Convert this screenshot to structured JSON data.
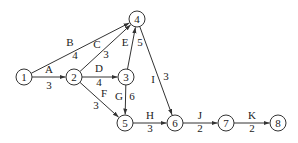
{
  "nodes": [
    {
      "id": "1",
      "label": "1",
      "x": 24,
      "y": 77
    },
    {
      "id": "2",
      "label": "2",
      "x": 74,
      "y": 77
    },
    {
      "id": "3",
      "label": "3",
      "x": 126,
      "y": 77
    },
    {
      "id": "4",
      "label": "4",
      "x": 137,
      "y": 19
    },
    {
      "id": "5",
      "label": "5",
      "x": 125,
      "y": 123
    },
    {
      "id": "6",
      "label": "6",
      "x": 175,
      "y": 123
    },
    {
      "id": "7",
      "label": "7",
      "x": 226,
      "y": 123
    },
    {
      "id": "8",
      "label": "8",
      "x": 278,
      "y": 123
    }
  ],
  "edges": [
    {
      "activity": "A",
      "duration": "3",
      "from": "1",
      "to": "2",
      "lx": 49,
      "ly": 73,
      "dx": 49,
      "dy": 89
    },
    {
      "activity": "B",
      "duration": "4",
      "from": "1",
      "to": "4",
      "lx": 70,
      "ly": 46,
      "dx": 75,
      "dy": 59
    },
    {
      "activity": "C",
      "duration": "3",
      "from": "2",
      "to": "4",
      "lx": 97,
      "ly": 48,
      "dx": 106,
      "dy": 58
    },
    {
      "activity": "D",
      "duration": "4",
      "from": "2",
      "to": "3",
      "lx": 99,
      "ly": 72,
      "dx": 99,
      "dy": 86
    },
    {
      "activity": "E",
      "duration": "5",
      "from": "3",
      "to": "4",
      "lx": 125,
      "ly": 46,
      "dx": 140,
      "dy": 46
    },
    {
      "activity": "F",
      "duration": "3",
      "from": "2",
      "to": "5",
      "lx": 104,
      "ly": 97,
      "dx": 96,
      "dy": 109
    },
    {
      "activity": "G",
      "duration": "6",
      "from": "3",
      "to": "5",
      "lx": 119,
      "ly": 100,
      "dx": 132,
      "dy": 100
    },
    {
      "activity": "H",
      "duration": "3",
      "from": "5",
      "to": "6",
      "lx": 150,
      "ly": 119,
      "dx": 150,
      "dy": 132
    },
    {
      "activity": "I",
      "duration": "3",
      "from": "4",
      "to": "6",
      "lx": 153,
      "ly": 83,
      "dx": 166,
      "dy": 80
    },
    {
      "activity": "J",
      "duration": "2",
      "from": "6",
      "to": "7",
      "lx": 200,
      "ly": 119,
      "dx": 200,
      "dy": 132
    },
    {
      "activity": "K",
      "duration": "2",
      "from": "7",
      "to": "8",
      "lx": 252,
      "ly": 119,
      "dx": 252,
      "dy": 132
    }
  ],
  "style": {
    "stroke_color": "#333333",
    "node_radius": 8
  }
}
